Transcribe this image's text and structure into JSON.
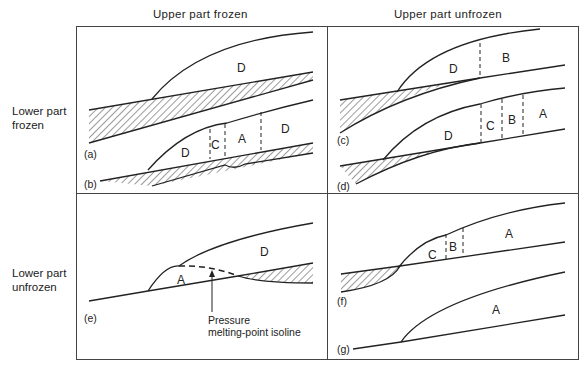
{
  "column_headers": [
    "Upper part frozen",
    "Upper part unfrozen"
  ],
  "row_labels": [
    {
      "line1": "Lower part",
      "line2": "frozen"
    },
    {
      "line1": "Lower part",
      "line2": "unfrozen"
    }
  ],
  "panels": {
    "a": {
      "caption": "(a)",
      "zones": [
        "D"
      ]
    },
    "b": {
      "caption": "(b)",
      "zones": [
        "D",
        "C",
        "A",
        "D"
      ]
    },
    "c": {
      "caption": "(c)",
      "zones": [
        "D",
        "B"
      ]
    },
    "d": {
      "caption": "(d)",
      "zones": [
        "D",
        "C",
        "B",
        "A"
      ]
    },
    "e": {
      "caption": "(e)",
      "zones": [
        "A",
        "D"
      ],
      "annotation_line1": "Pressure",
      "annotation_line2": "melting-point isoline"
    },
    "f": {
      "caption": "(f)",
      "zones": [
        "C",
        "B",
        "A"
      ]
    },
    "g": {
      "caption": "(g)",
      "zones": [
        "A"
      ]
    }
  },
  "colors": {
    "line": "#222222",
    "frame": "#444444",
    "background": "#ffffff"
  }
}
